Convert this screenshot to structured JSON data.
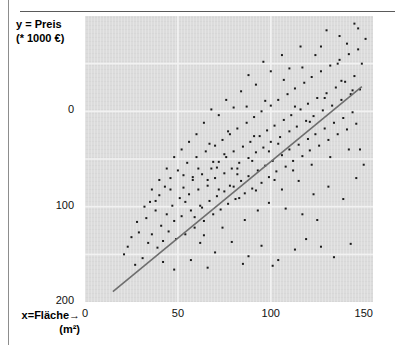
{
  "page": {
    "clipped_header_text": "",
    "background_color": "#ffffff"
  },
  "axis": {
    "y_title_line1": "y = Preis",
    "y_title_line2": "(* 1000 €)",
    "x_title_line1": "x=Fläche→",
    "x_title_line2": "(m²)",
    "y_ticks": [
      "200",
      "100",
      "0"
    ],
    "x_ticks": [
      "0",
      "50",
      "100",
      "150"
    ]
  },
  "colors": {
    "plot_background": "#dcdcdc",
    "gridline": "#f2f2f2",
    "point": "#1a1a1a",
    "regression_line": "#6e6e6e",
    "rule": "#5a5a5a"
  },
  "chart_data": {
    "type": "scatter",
    "title": "",
    "subtitle": "",
    "xlabel": "x=Fläche→ (m²)",
    "ylabel": "y = Preis (* 1000 €)",
    "xlim": [
      0,
      155
    ],
    "ylim": [
      0,
      300
    ],
    "xticks": [
      0,
      50,
      100,
      150
    ],
    "yticks": [
      0,
      100,
      200
    ],
    "grid": true,
    "gridlines_x": [
      50,
      100
    ],
    "gridlines_y": [
      50,
      100,
      150,
      200,
      250
    ],
    "legend": null,
    "legend_position": "none",
    "annotations": [],
    "series": [
      {
        "name": "Wohnungen",
        "type": "scatter",
        "marker": "square",
        "marker_size": 2,
        "color": "#1a1a1a",
        "points": [
          [
            23,
            58
          ],
          [
            27,
            39
          ],
          [
            29,
            73
          ],
          [
            31,
            46
          ],
          [
            33,
            88
          ],
          [
            34,
            62
          ],
          [
            35,
            105
          ],
          [
            36,
            71
          ],
          [
            38,
            96
          ],
          [
            39,
            57
          ],
          [
            40,
            112
          ],
          [
            41,
            80
          ],
          [
            42,
            64
          ],
          [
            43,
            121
          ],
          [
            44,
            92
          ],
          [
            45,
            74
          ],
          [
            46,
            130
          ],
          [
            47,
            101
          ],
          [
            48,
            85
          ],
          [
            49,
            66
          ],
          [
            50,
            138
          ],
          [
            51,
            109
          ],
          [
            52,
            90
          ],
          [
            53,
            120
          ],
          [
            54,
            71
          ],
          [
            55,
            146
          ],
          [
            56,
            113
          ],
          [
            57,
            96
          ],
          [
            58,
            128
          ],
          [
            59,
            78
          ],
          [
            60,
            152
          ],
          [
            61,
            118
          ],
          [
            62,
            101
          ],
          [
            62,
            62
          ],
          [
            63,
            134
          ],
          [
            64,
            85
          ],
          [
            65,
            158
          ],
          [
            66,
            122
          ],
          [
            67,
            106
          ],
          [
            68,
            140
          ],
          [
            69,
            92
          ],
          [
            70,
            164
          ],
          [
            70,
            130
          ],
          [
            71,
            111
          ],
          [
            72,
            147
          ],
          [
            73,
            97
          ],
          [
            74,
            170
          ],
          [
            75,
            135
          ],
          [
            75,
            116
          ],
          [
            76,
            152
          ],
          [
            77,
            103
          ],
          [
            78,
            176
          ],
          [
            79,
            140
          ],
          [
            80,
            121
          ],
          [
            80,
            158
          ],
          [
            81,
            108
          ],
          [
            82,
            182
          ],
          [
            83,
            146
          ],
          [
            84,
            127
          ],
          [
            85,
            163
          ],
          [
            86,
            114
          ],
          [
            87,
            188
          ],
          [
            88,
            151
          ],
          [
            88,
            132
          ],
          [
            89,
            168
          ],
          [
            90,
            119
          ],
          [
            91,
            194
          ],
          [
            92,
            157
          ],
          [
            93,
            138
          ],
          [
            94,
            174
          ],
          [
            95,
            125
          ],
          [
            95,
            200
          ],
          [
            96,
            162
          ],
          [
            97,
            143
          ],
          [
            98,
            180
          ],
          [
            99,
            131
          ],
          [
            100,
            206
          ],
          [
            100,
            168
          ],
          [
            101,
            148
          ],
          [
            102,
            185
          ],
          [
            103,
            137
          ],
          [
            104,
            212
          ],
          [
            105,
            173
          ],
          [
            106,
            154
          ],
          [
            107,
            191
          ],
          [
            108,
            142
          ],
          [
            109,
            218
          ],
          [
            110,
            179
          ],
          [
            110,
            160
          ],
          [
            111,
            196
          ],
          [
            112,
            148
          ],
          [
            113,
            224
          ],
          [
            114,
            184
          ],
          [
            115,
            165
          ],
          [
            116,
            202
          ],
          [
            117,
            153
          ],
          [
            118,
            230
          ],
          [
            119,
            190
          ],
          [
            120,
            171
          ],
          [
            120,
            208
          ],
          [
            121,
            159
          ],
          [
            122,
            236
          ],
          [
            123,
            195
          ],
          [
            124,
            176
          ],
          [
            125,
            214
          ],
          [
            126,
            164
          ],
          [
            127,
            242
          ],
          [
            128,
            201
          ],
          [
            129,
            182
          ],
          [
            130,
            219
          ],
          [
            131,
            170
          ],
          [
            132,
            248
          ],
          [
            133,
            206
          ],
          [
            134,
            188
          ],
          [
            135,
            225
          ],
          [
            136,
            176
          ],
          [
            137,
            254
          ],
          [
            138,
            212
          ],
          [
            139,
            193
          ],
          [
            140,
            231
          ],
          [
            141,
            181
          ],
          [
            142,
            260
          ],
          [
            143,
            218
          ],
          [
            144,
            199
          ],
          [
            145,
            237
          ],
          [
            146,
            187
          ],
          [
            147,
            265
          ],
          [
            148,
            223
          ],
          [
            58,
            131
          ],
          [
            63,
            99
          ],
          [
            67,
            166
          ],
          [
            72,
            118
          ],
          [
            77,
            179
          ],
          [
            82,
            134
          ],
          [
            87,
            205
          ],
          [
            92,
            117
          ],
          [
            97,
            211
          ],
          [
            102,
            128
          ],
          [
            107,
            233
          ],
          [
            112,
            138
          ],
          [
            117,
            246
          ],
          [
            122,
            144
          ],
          [
            127,
            268
          ],
          [
            132,
            152
          ],
          [
            137,
            279
          ],
          [
            142,
            160
          ],
          [
            147,
            287
          ],
          [
            110,
            245
          ],
          [
            116,
            268
          ],
          [
            124,
            259
          ],
          [
            130,
            285
          ],
          [
            136,
            250
          ],
          [
            141,
            271
          ],
          [
            145,
            292
          ],
          [
            106,
            259
          ],
          [
            100,
            242
          ],
          [
            96,
            252
          ],
          [
            92,
            228
          ],
          [
            88,
            238
          ],
          [
            84,
            221
          ],
          [
            80,
            204
          ],
          [
            76,
            212
          ],
          [
            72,
            196
          ],
          [
            68,
            202
          ],
          [
            64,
            188
          ],
          [
            60,
            176
          ],
          [
            56,
            168
          ],
          [
            52,
            160
          ],
          [
            48,
            152
          ],
          [
            44,
            140
          ],
          [
            40,
            128
          ],
          [
            36,
            118
          ],
          [
            32,
            100
          ],
          [
            28,
            84
          ],
          [
            25,
            68
          ],
          [
            21,
            50
          ],
          [
            54,
            105
          ],
          [
            59,
            89
          ],
          [
            66,
            128
          ],
          [
            71,
            141
          ],
          [
            78,
            122
          ],
          [
            83,
            109
          ],
          [
            91,
            174
          ],
          [
            99,
            158
          ],
          [
            104,
            166
          ],
          [
            113,
            205
          ],
          [
            121,
            189
          ],
          [
            129,
            214
          ],
          [
            138,
            232
          ],
          [
            144,
            222
          ],
          [
            149,
            250
          ],
          [
            151,
            276
          ],
          [
            70,
            52
          ],
          [
            79,
            63
          ],
          [
            88,
            48
          ],
          [
            95,
            59
          ],
          [
            104,
            44
          ],
          [
            113,
            55
          ],
          [
            85,
            40
          ],
          [
            101,
            38
          ],
          [
            119,
            66
          ],
          [
            127,
            58
          ],
          [
            134,
            47
          ],
          [
            143,
            61
          ],
          [
            57,
            44
          ],
          [
            66,
            36
          ],
          [
            48,
            34
          ],
          [
            42,
            42
          ],
          [
            93,
            96
          ],
          [
            86,
            86
          ],
          [
            74,
            78
          ],
          [
            64,
            70
          ],
          [
            99,
            104
          ],
          [
            108,
            98
          ],
          [
            117,
            92
          ],
          [
            125,
            86
          ],
          [
            106,
            118
          ],
          [
            115,
            127
          ],
          [
            123,
            113
          ],
          [
            131,
            121
          ],
          [
            139,
            108
          ],
          [
            146,
            130
          ],
          [
            150,
            144
          ],
          [
            148,
            160
          ],
          [
            90,
            148
          ],
          [
            82,
            140
          ],
          [
            75,
            155
          ],
          [
            69,
            147
          ],
          [
            61,
            140
          ],
          [
            53,
            133
          ],
          [
            46,
            118
          ],
          [
            38,
            106
          ]
        ]
      }
    ],
    "regression_line": {
      "name": "Regressionsgerade",
      "color": "#6e6e6e",
      "x_start": 15,
      "y_start": 11,
      "x_end": 149,
      "y_end": 226
    }
  }
}
